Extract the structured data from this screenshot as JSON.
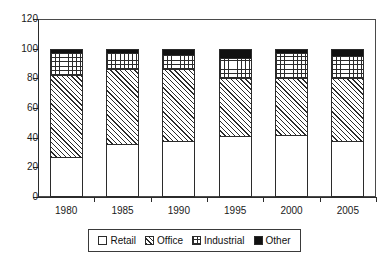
{
  "chart_data": {
    "type": "bar",
    "subtype": "stacked-bar",
    "title": "",
    "xlabel": "",
    "ylabel": "",
    "categories": [
      "1980",
      "1985",
      "1990",
      "1995",
      "2000",
      "2005"
    ],
    "series": [
      {
        "name": "Retail",
        "pattern": "solid-white",
        "values": [
          27,
          36,
          38,
          41,
          42,
          38
        ]
      },
      {
        "name": "Office",
        "pattern": "diagonal-hatch",
        "values": [
          55,
          50,
          48,
          39,
          38,
          42
        ]
      },
      {
        "name": "Industrial",
        "pattern": "cross-hatch",
        "values": [
          15,
          11,
          10,
          14,
          17,
          15
        ]
      },
      {
        "name": "Other",
        "pattern": "solid-black",
        "values": [
          3,
          3,
          4,
          6,
          3,
          5
        ]
      }
    ],
    "cumulative_tops": [
      [
        27,
        82,
        97,
        100
      ],
      [
        36,
        86,
        97,
        100
      ],
      [
        38,
        86,
        96,
        100
      ],
      [
        41,
        80,
        94,
        100
      ],
      [
        42,
        80,
        97,
        100
      ],
      [
        38,
        80,
        95,
        100
      ]
    ],
    "ylim": [
      0,
      120
    ],
    "yticks": [
      0,
      20,
      40,
      60,
      80,
      100,
      120
    ],
    "ytick_labels": [
      "0",
      "20",
      "40",
      "60",
      "80",
      "100",
      "120"
    ],
    "grid": false,
    "legend_position": "bottom",
    "legend_entries": [
      {
        "label": "Retail",
        "swatch": "white-square"
      },
      {
        "label": "Office",
        "swatch": "diagonal-hatch-square"
      },
      {
        "label": "Industrial",
        "swatch": "cross-hatch-square"
      },
      {
        "label": "Other",
        "swatch": "black-square"
      }
    ],
    "colors": {
      "line": "#2b2b2b",
      "retail": "#ffffff",
      "office": "#ffffff",
      "industrial": "#ffffff",
      "other": "#111111",
      "background": "#ffffff"
    }
  }
}
